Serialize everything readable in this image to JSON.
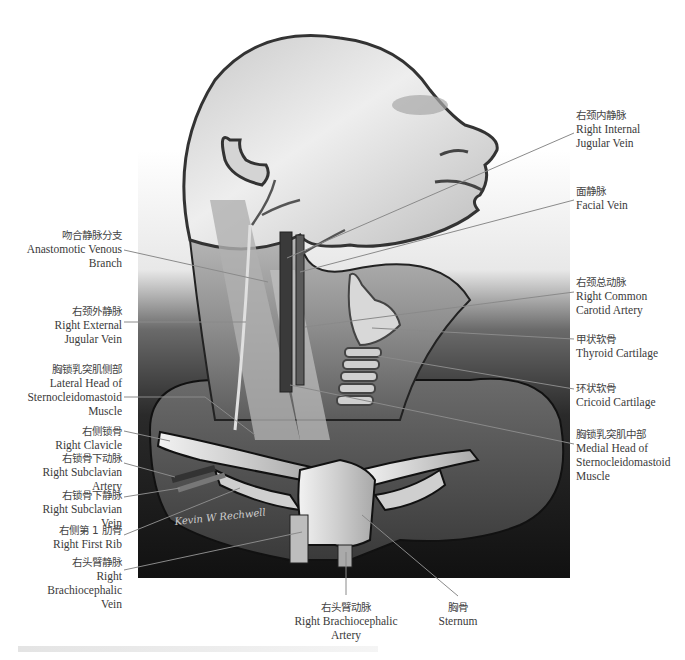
{
  "figure": {
    "signature": "Kevin W Rechwell"
  },
  "labels": [
    {
      "id": "right-internal-jugular-vein",
      "zh": "右颈内静脉",
      "en": [
        "Right Internal",
        "Jugular Vein"
      ],
      "side": "right",
      "x": 576,
      "y": 108,
      "leader": [
        [
          574,
          133
        ],
        [
          287,
          258
        ]
      ]
    },
    {
      "id": "facial-vein",
      "zh": "面静脉",
      "en": [
        "Facial Vein"
      ],
      "side": "right",
      "x": 576,
      "y": 184,
      "leader": [
        [
          574,
          200
        ],
        [
          300,
          272
        ]
      ]
    },
    {
      "id": "anastomotic-venous-branch",
      "zh": "吻合静脉分支",
      "en": [
        "Anastomotic Venous",
        "Branch"
      ],
      "side": "left",
      "x": 20,
      "y": 228,
      "leader": [
        [
          124,
          250
        ],
        [
          268,
          282
        ]
      ]
    },
    {
      "id": "right-common-carotid-artery",
      "zh": "右颈总动脉",
      "en": [
        "Right Common",
        "Carotid Artery"
      ],
      "side": "right",
      "x": 576,
      "y": 275,
      "leader": [
        [
          574,
          292
        ],
        [
          305,
          327
        ]
      ]
    },
    {
      "id": "thyroid-cartilage",
      "zh": "甲状软骨",
      "en": [
        "Thyroid Cartilage"
      ],
      "side": "right",
      "x": 576,
      "y": 332,
      "leader": [
        [
          574,
          339
        ],
        [
          372,
          328
        ]
      ]
    },
    {
      "id": "right-external-jugular-vein",
      "zh": "右颈外静脉",
      "en": [
        "Right External",
        "Jugular Vein"
      ],
      "side": "left",
      "x": 20,
      "y": 304,
      "leader": [
        [
          124,
          322
        ],
        [
          246,
          322
        ]
      ]
    },
    {
      "id": "lateral-head-scm",
      "zh": "胸锁乳突肌侧部",
      "en": [
        "Lateral Head of",
        "Sternocleidomastoid",
        "Muscle"
      ],
      "side": "left",
      "x": 20,
      "y": 362,
      "leader": [
        [
          124,
          397
        ],
        [
          205,
          397
        ],
        [
          255,
          435
        ]
      ]
    },
    {
      "id": "cricoid-cartilage",
      "zh": "环状软骨",
      "en": [
        "Cricoid Cartilage"
      ],
      "side": "right",
      "x": 576,
      "y": 381,
      "leader": [
        [
          574,
          389
        ],
        [
          378,
          356
        ]
      ]
    },
    {
      "id": "medial-head-scm",
      "zh": "胸锁乳突肌中部",
      "en": [
        "Medial Head of",
        "Sternocleidomastoid",
        "Muscle"
      ],
      "side": "right",
      "x": 576,
      "y": 427,
      "leader": [
        [
          574,
          444
        ],
        [
          290,
          385
        ]
      ]
    },
    {
      "id": "right-clavicle",
      "zh": "右侧锁骨",
      "en": [
        "Right Clavicle"
      ],
      "side": "left",
      "x": 20,
      "y": 424,
      "leader": [
        [
          124,
          431
        ],
        [
          170,
          441
        ]
      ]
    },
    {
      "id": "right-subclavian-artery",
      "zh": "右锁骨下动脉",
      "en": [
        "Right Subclavian Artery"
      ],
      "side": "left",
      "x": 20,
      "y": 451,
      "leader": [
        [
          124,
          463
        ],
        [
          175,
          477
        ]
      ]
    },
    {
      "id": "right-subclavian-vein",
      "zh": "右锁骨下静脉",
      "en": [
        "Right Subclavian Vein"
      ],
      "side": "left",
      "x": 20,
      "y": 488,
      "leader": [
        [
          124,
          497
        ],
        [
          180,
          488
        ]
      ]
    },
    {
      "id": "right-first-rib",
      "zh": "右侧第 1 肋骨",
      "en": [
        "Right First Rib"
      ],
      "side": "left",
      "x": 20,
      "y": 523,
      "leader": [
        [
          124,
          535
        ],
        [
          240,
          488
        ]
      ]
    },
    {
      "id": "right-brachiocephalic-vein",
      "zh": "右头臂静脉",
      "en": [
        "Right Brachiocephalic",
        "Vein"
      ],
      "side": "left",
      "x": 20,
      "y": 555,
      "leader": [
        [
          124,
          570
        ],
        [
          302,
          532
        ]
      ]
    },
    {
      "id": "right-brachiocephalic-artery",
      "zh": "右头臂动脉",
      "en": [
        "Right Brachiocephalic",
        "Artery"
      ],
      "side": "center",
      "x": 270,
      "y": 600,
      "leader": [
        [
          346,
          595
        ],
        [
          346,
          552
        ]
      ]
    },
    {
      "id": "sternum",
      "zh": "胸骨",
      "en": [
        "Sternum"
      ],
      "side": "center",
      "x": 420,
      "y": 600,
      "leader": [
        [
          458,
          596
        ],
        [
          362,
          515
        ]
      ]
    }
  ],
  "colors": {
    "leader": "#8a8a8a",
    "background_dark": "#1a1a1a",
    "skin_light": "#e6e6e6",
    "skin_mid": "#9a9a9a",
    "bone": "#d9d9d9"
  }
}
